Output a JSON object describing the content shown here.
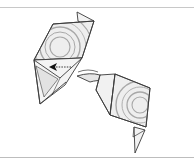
{
  "figure": {
    "type": "origami-folding-step",
    "colors": {
      "background": "#ffffff",
      "outline": "#3a3a3a",
      "paper_fill": "#ececec",
      "paper_light": "#f6f6f6",
      "paper_shade": "#d9d9d9",
      "swirl": "#a8a8a8",
      "rule": "#c4c4c4",
      "arrow": "#111111"
    },
    "pieces": [
      {
        "name": "upper-left-piece",
        "has_swirl_pattern": true
      },
      {
        "name": "lower-right-piece",
        "has_swirl_pattern": true
      }
    ],
    "annotations": [
      {
        "name": "fold-arrow",
        "direction": "left",
        "style": "dashed-shaft-solid-head"
      }
    ]
  }
}
